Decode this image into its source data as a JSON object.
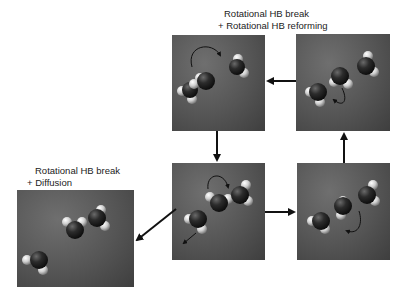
{
  "figure": {
    "labels": {
      "top": [
        "Rotational HB break",
        "+ Rotational HB reforming"
      ],
      "left": [
        "Rotational HB break",
        "+ Diffusion"
      ]
    },
    "panels": [
      {
        "id": "top-center",
        "description": "three water molecules, rotational HB break and reforming"
      },
      {
        "id": "top-right",
        "description": "three water molecules hydrogen-bonded chain with rotation arrow"
      },
      {
        "id": "bottom-center",
        "description": "three water molecules, central one rotating, one diffusing away"
      },
      {
        "id": "bottom-right",
        "description": "three water molecules in chain, rotation arrow"
      },
      {
        "id": "left",
        "description": "three water molecules after diffusion, one separated"
      }
    ],
    "flow": [
      {
        "from": "top-right",
        "to": "top-center"
      },
      {
        "from": "top-center",
        "to": "bottom-center"
      },
      {
        "from": "bottom-center",
        "to": "bottom-right"
      },
      {
        "from": "bottom-right",
        "to": "top-right"
      },
      {
        "from": "bottom-center",
        "to": "left"
      }
    ],
    "colors": {
      "panel": "#555555",
      "oxygen": "#2a2a2a",
      "hydrogen": "#e6e6e6",
      "arrow": "#111111"
    }
  }
}
